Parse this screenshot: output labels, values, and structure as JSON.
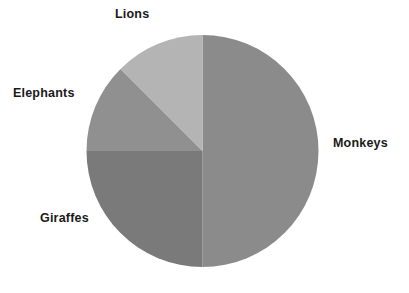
{
  "chart_data": {
    "type": "pie",
    "title": "",
    "subtitle": "",
    "xlabel": "",
    "ylabel": "",
    "grid": false,
    "legend_position": "none",
    "labels_position": "outside",
    "start_angle_deg": 90,
    "direction": "clockwise",
    "categories": [
      "Monkeys",
      "Giraffes",
      "Elephants",
      "Lions"
    ],
    "values": [
      50,
      25,
      12.5,
      12.5
    ],
    "units": "percent",
    "slices": [
      {
        "label": "Monkeys",
        "value": 50,
        "percent": 50,
        "angle_deg": 180,
        "start_deg": 0,
        "end_deg": 180,
        "color": "#8b8b8b",
        "label_x": 333,
        "label_y": 137
      },
      {
        "label": "Giraffes",
        "value": 25,
        "percent": 25,
        "angle_deg": 90,
        "start_deg": 180,
        "end_deg": 270,
        "color": "#7a7a7a",
        "label_x": 40,
        "label_y": 212
      },
      {
        "label": "Elephants",
        "value": 12.5,
        "percent": 12.5,
        "angle_deg": 45,
        "start_deg": 270,
        "end_deg": 315,
        "color": "#909090",
        "label_x": 13,
        "label_y": 87
      },
      {
        "label": "Lions",
        "value": 12.5,
        "percent": 12.5,
        "angle_deg": 45,
        "start_deg": 315,
        "end_deg": 360,
        "color": "#b4b4b4",
        "label_x": 115,
        "label_y": 8
      }
    ],
    "geometry": {
      "center_x": 202.5,
      "center_y": 151,
      "radius": 116
    },
    "background_color": "#ffffff",
    "label_color": "#1a1a1a"
  }
}
